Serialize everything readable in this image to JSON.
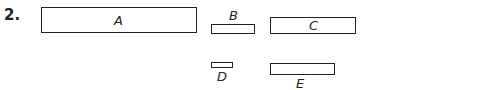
{
  "problem_number": "2.",
  "shapes": [
    {
      "label": "A",
      "label_position": "inside"
    },
    {
      "label": "B",
      "label_position": "above"
    },
    {
      "label": "C",
      "label_position": "inside"
    },
    {
      "label": "D",
      "label_position": "below"
    },
    {
      "label": "E",
      "label_position": "below"
    }
  ],
  "colors": {
    "stroke": "#222222",
    "background": "#ffffff"
  }
}
